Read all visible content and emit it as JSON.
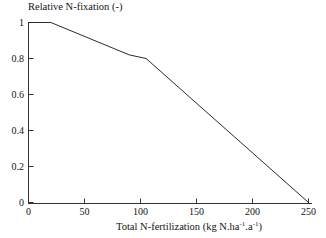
{
  "chart_data": {
    "type": "line",
    "title": "",
    "ylabel": "Relative N-fixation (-)",
    "xlabel_prefix": "Total N-fertilization (kg N.ha",
    "xlabel_sup1": "-1",
    "xlabel_mid": ".a",
    "xlabel_sup2": "-1",
    "xlabel_suffix": ")",
    "xlabel_plain": "Total N-fertilization (kg N.ha-1.a-1)",
    "xlim": [
      0,
      250
    ],
    "ylim": [
      0,
      1
    ],
    "xticks": [
      0,
      50,
      100,
      150,
      200,
      250
    ],
    "xtick_labels": [
      "0",
      "50",
      "100",
      "150",
      "200",
      "250"
    ],
    "yticks": [
      0,
      0.2,
      0.4,
      0.6,
      0.8,
      1
    ],
    "ytick_labels": [
      "0",
      "0.2",
      "0.4",
      "0.6",
      "0.8",
      "1"
    ],
    "grid": false,
    "legend": null,
    "line_color": "#2b2b2b",
    "axis_color": "#333333",
    "background": "#ffffff",
    "series": [
      {
        "name": "Relative N-fixation",
        "x": [
          0,
          20,
          90,
          105,
          250
        ],
        "values": [
          1.0,
          1.0,
          0.82,
          0.8,
          0.0
        ]
      }
    ]
  }
}
